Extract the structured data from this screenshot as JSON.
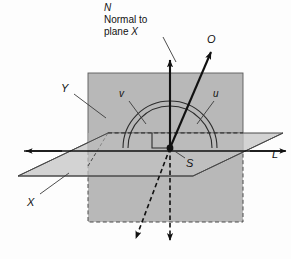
{
  "figure": {
    "width": 291,
    "height": 259,
    "background_color": "#fdfdfd",
    "plane_fill_color": "#b8b8b8",
    "plane_edge_color": "#4a4a4a",
    "line_color": "#111111"
  },
  "labels": {
    "normal_N": "N",
    "normal_line1": "Normal to",
    "normal_line2_prefix": "plane ",
    "normal_line2_italic": "X",
    "vector_O": "O",
    "plane_Y": "Y",
    "angle_v": "v",
    "angle_u": "u",
    "point_S": "S",
    "line_L": "L",
    "plane_X": "X"
  },
  "geometry": {
    "station_point": {
      "x": 170,
      "y": 148
    },
    "plane_Y_rect": {
      "left": 88,
      "top": 73,
      "right": 243,
      "bottom": 222
    },
    "plane_X_parallelogram": [
      {
        "x": 18,
        "y": 176
      },
      {
        "x": 108,
        "y": 133
      },
      {
        "x": 283,
        "y": 133
      },
      {
        "x": 193,
        "y": 176
      }
    ],
    "strike_line_L": {
      "x1": 22,
      "y1": 151,
      "x2": 287,
      "y2": 151
    },
    "normal_vector_N": {
      "x1": 170,
      "y1": 148,
      "x2": 170,
      "y2": 58
    },
    "vector_O": {
      "x1": 170,
      "y1": 148,
      "x2": 212,
      "y2": 50
    },
    "dashed_vertical": {
      "x1": 170,
      "y1": 148,
      "x2": 170,
      "y2": 245
    },
    "dashed_oblique": {
      "x1": 170,
      "y1": 148,
      "x2": 133,
      "y2": 243
    },
    "arc_outer_radius": 47,
    "arc_inner_radius": 42,
    "right_angle_marker": {
      "x": 152,
      "y": 133,
      "size": 17
    }
  },
  "annotation_leaders": {
    "normal_leader": {
      "x1": 163,
      "y1": 36,
      "x2": 174,
      "y2": 60
    },
    "Y_leader": {
      "x1": 73,
      "y1": 93,
      "x2": 104,
      "y2": 117
    },
    "v_leader": {
      "x1": 128,
      "y1": 100,
      "x2": 145,
      "y2": 122
    },
    "u_leader": {
      "x1": 213,
      "y1": 100,
      "x2": 196,
      "y2": 122
    },
    "S_leader": {
      "x1": 184,
      "y1": 158,
      "x2": 173,
      "y2": 150
    },
    "X_leader": {
      "x1": 39,
      "y1": 194,
      "x2": 68,
      "y2": 174
    }
  }
}
